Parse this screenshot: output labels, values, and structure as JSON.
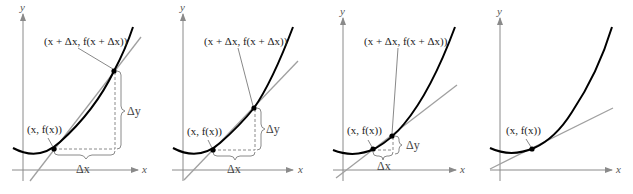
{
  "figure": {
    "colors": {
      "curve": "#000000",
      "secant": "#a0a0a0",
      "axis": "#8a8a8a"
    },
    "panels": [
      {
        "axis_x_label": "x",
        "axis_y_label": "y",
        "point1_label": "(x, f(x))",
        "point2_label": "(x + Δx, f(x + Δx))",
        "dx_label": "Δx",
        "dy_label": "Δy"
      },
      {
        "axis_x_label": "x",
        "axis_y_label": "y",
        "point1_label": "(x, f(x))",
        "point2_label": "(x + Δx, f(x + Δx))",
        "dx_label": "Δx",
        "dy_label": "Δy"
      },
      {
        "axis_x_label": "x",
        "axis_y_label": "y",
        "point1_label": "(x, f(x))",
        "point2_label": "(x + Δx, f(x + Δx))",
        "dx_label": "Δx",
        "dy_label": "Δy"
      },
      {
        "axis_x_label": "x",
        "axis_y_label": "y",
        "point1_label": "(x, f(x))"
      }
    ]
  }
}
